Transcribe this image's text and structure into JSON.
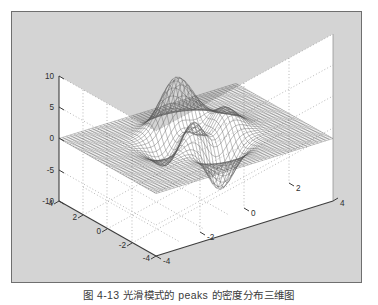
{
  "figure": {
    "kind": "matlab-figure-window",
    "background_color": "#d4d4d4",
    "border_color": "#6f6f6f",
    "axes_background_color": "#ffffff",
    "grid_color": "#9a9a9a",
    "axis_line_color": "#4a4a4a",
    "mesh_color": "#4c4c4c"
  },
  "caption": {
    "text": "图 4-13  光滑模式的 peaks 的密度分布三维图"
  },
  "chart_data": {
    "type": "surface",
    "title": "",
    "subtitle": "",
    "xlabel": "",
    "ylabel": "",
    "zlabel": "",
    "function": "peaks",
    "surface_style": "mesh",
    "grid": true,
    "legend": null,
    "view_azimuth": -37.5,
    "view_elevation": 30,
    "xlim": [
      -4,
      4
    ],
    "ylim": [
      -4,
      4
    ],
    "zlim": [
      -10,
      10
    ],
    "x_ticks": [
      -4,
      -2,
      0,
      2,
      4
    ],
    "x_tick_labels": [
      "-4",
      "-2",
      "0",
      "2",
      "4"
    ],
    "y_ticks": [
      -4,
      -2,
      0,
      2,
      4
    ],
    "y_tick_labels": [
      "4",
      "2",
      "0",
      "-2",
      "-4"
    ],
    "z_ticks": [
      -10,
      -5,
      0,
      5,
      10
    ],
    "z_tick_labels": [
      "-10",
      "-5",
      "0",
      "5",
      "10"
    ],
    "features": [
      {
        "name": "primary-peak",
        "x": -0.01,
        "y": 1.58,
        "z": 8.11
      },
      {
        "name": "secondary-peak",
        "x": 1.3,
        "y": -0.0,
        "z": 3.78
      },
      {
        "name": "primary-valley",
        "x": 0.23,
        "y": -1.63,
        "z": -6.55
      },
      {
        "name": "shallow-dip",
        "x": -1.35,
        "y": 0.2,
        "z": -3.05
      }
    ],
    "grid_resolution": 49
  }
}
